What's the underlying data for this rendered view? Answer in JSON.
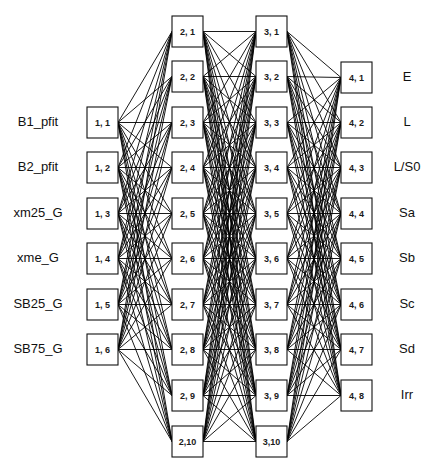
{
  "diagram": {
    "type": "feed-forward neural network",
    "colors": {
      "line": "#000000",
      "box_fill": "#ffffff",
      "box_stroke": "#111111",
      "text": "#111111"
    },
    "layers": [
      {
        "name": "layer-1",
        "x": 87,
        "tops": [
          107,
          152,
          198,
          243,
          289,
          334
        ],
        "nodes": [
          "1, 1",
          "1, 2",
          "1, 3",
          "1, 4",
          "1, 5",
          "1, 6"
        ]
      },
      {
        "name": "layer-2",
        "x": 172,
        "tops": [
          16,
          61,
          107,
          152,
          198,
          243,
          289,
          334,
          380,
          426
        ],
        "nodes": [
          "2, 1",
          "2, 2",
          "2, 3",
          "2, 4",
          "2, 5",
          "2, 6",
          "2, 7",
          "2, 8",
          "2, 9",
          "2,10"
        ]
      },
      {
        "name": "layer-3",
        "x": 256,
        "tops": [
          16,
          61,
          107,
          152,
          198,
          243,
          289,
          334,
          380,
          426
        ],
        "nodes": [
          "3, 1",
          "3, 2",
          "3, 3",
          "3, 4",
          "3, 5",
          "3, 6",
          "3, 7",
          "3, 8",
          "3, 9",
          "3,10"
        ]
      },
      {
        "name": "layer-4",
        "x": 341,
        "tops": [
          62,
          107,
          152,
          198,
          243,
          289,
          334,
          380
        ],
        "nodes": [
          "4, 1",
          "4, 2",
          "4, 3",
          "4, 4",
          "4, 5",
          "4, 6",
          "4, 7",
          "4, 8"
        ]
      }
    ],
    "box": {
      "w": 31,
      "h": 31
    },
    "inputs": [
      "B1_pfit",
      "B2_pfit",
      "xm25_G",
      "xme_G",
      "SB25_G",
      "SB75_G"
    ],
    "outputs": [
      "E",
      "L",
      "L/S0",
      "Sa",
      "Sb",
      "Sc",
      "Sd",
      "Irr"
    ],
    "connectivity": "fully connected between adjacent layers"
  }
}
